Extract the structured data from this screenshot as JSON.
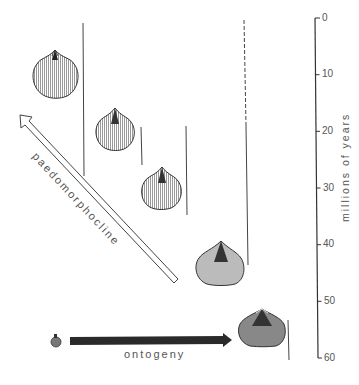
{
  "axis": {
    "title": "millions of years",
    "ticks": [
      "0",
      "10",
      "20",
      "30",
      "40",
      "50",
      "60"
    ],
    "range": [
      0,
      60
    ]
  },
  "labels": {
    "paedomorphocline": "paedomorphocline",
    "ontogeny": "ontogeny"
  },
  "shells": [
    {
      "name": "shell-1",
      "ranges_myr": [
        0,
        28
      ]
    },
    {
      "name": "shell-2",
      "ranges_myr": [
        19,
        26
      ]
    },
    {
      "name": "shell-3",
      "ranges_myr": [
        19,
        35
      ]
    },
    {
      "name": "shell-4",
      "ranges_myr": [
        0,
        44
      ],
      "dashed_until_myr": 19
    },
    {
      "name": "shell-5-adult",
      "ranges_myr": [
        53,
        60
      ]
    },
    {
      "name": "juvenile"
    }
  ],
  "colors": {
    "ink": "#3a3a3a",
    "text": "#555555",
    "background": "#ffffff"
  }
}
